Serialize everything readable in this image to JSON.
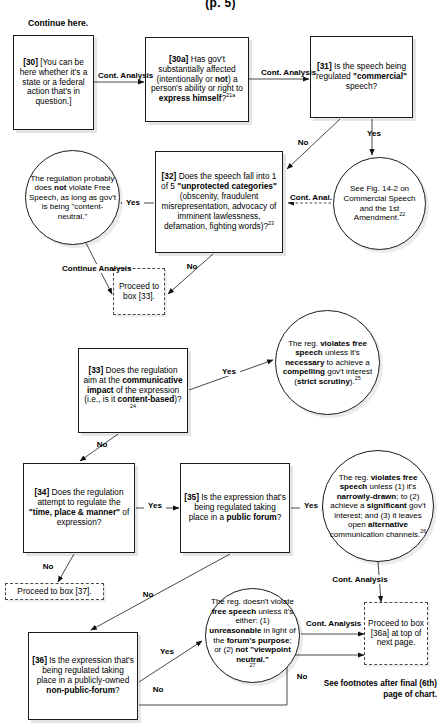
{
  "page": {
    "page_label": "(p. 5)",
    "continue_here": "Continue here.",
    "footnote_note": "See footnotes after final (6th) page of chart."
  },
  "nodes": {
    "box30": {
      "id": "[30]",
      "text": "[You can be here whether it's a state or a federal action that's in question.]"
    },
    "box30a": {
      "id": "[30a]",
      "text": "Has gov't substantially affected (intentionally or not) a person's ability or right to express himself?",
      "footnote": "21a"
    },
    "box31": {
      "id": "[31]",
      "text": "Is the speech being regulated \"commercial\" speech?"
    },
    "circle_content_neutral": {
      "text": "The regulation probably does not violate Free Speech, as long as gov't is being \"content-neutral.\""
    },
    "box32": {
      "id": "[32]",
      "text": "Does the speech fall into 1 of 5 \"unprotected categories\" (obscenity, fraudulent misrepresentation, advocacy of imminent lawlessness, defamation, fighting words)?",
      "footnote": "23"
    },
    "circle_commercial": {
      "text": "See Fig. 14-2 on Commercial Speech and the 1st Amendment.",
      "footnote": "22"
    },
    "proceed33": {
      "text": "Proceed to box [33]."
    },
    "box33": {
      "id": "[33]",
      "text": "Does the regulation aim at the communicative impact of the expression (i.e., is it content-based)?",
      "footnote": "24"
    },
    "circle_strict_scrutiny": {
      "text": "The reg. violates free speech unless it's necessary to achieve a compelling gov't interest (strict scrutiny).",
      "footnote": "25"
    },
    "box34": {
      "id": "[34]",
      "text": "Does the regulation attempt to regulate the \"time, place & manner\" of expression?"
    },
    "box35": {
      "id": "[35]",
      "text": "Is the expression that's being regulated taking place in a public forum?"
    },
    "circle_narrowly_drawn": {
      "text": "The reg. violates free speech unless (1) it's narrowly-drawn; to (2) achieve a significant gov't interest; and (3) it leaves open alternative communication channels.",
      "footnote": "26"
    },
    "proceed37": {
      "text": "Proceed to box [37]."
    },
    "box36": {
      "id": "[36]",
      "text": "Is the expression that's being regulated taking place in a publicly-owned non-public-forum?"
    },
    "circle_nonpublic": {
      "text": "The reg. doesn't violate free speech unless it's either: (1) unreasonable in light of the forum's purpose; or (2) not \"viewpoint neutral.\"",
      "footnote": "27"
    },
    "proceed36a": {
      "text": "Proceed to box [36a] at top of next page."
    }
  },
  "edge_labels": {
    "e30_30a": "Cont. Analysis",
    "e30a_31": "Cont. Analysis",
    "e31_no": "No",
    "e31_yes": "Yes",
    "e32_yes": "Yes",
    "e32_no": "No",
    "e32_commercial": "Cont. Anal.",
    "e_continue_analysis": "Continue Analysis",
    "e33_yes": "Yes",
    "e33_no": "No",
    "e34_yes": "Yes",
    "e34_no": "No",
    "e35_yes": "Yes",
    "e35_no": "No",
    "e36_yes": "Yes",
    "e36_no": "No",
    "e_circle_cont": "Cont. Analysis",
    "e_nonpublic_cont": "Cont. Analysis"
  }
}
